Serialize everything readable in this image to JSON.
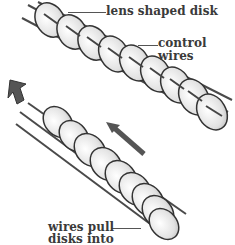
{
  "figure": {
    "colors": {
      "disk_fill": "#e8e8e8",
      "disk_edge": "#3c3c3c",
      "wire": "#4a4a4a",
      "arrow": "#555555",
      "background": "#ffffff"
    },
    "labels": {
      "lens_disk": "lens shaped disk",
      "control_wires_line1": "control",
      "control_wires_line2": "wires",
      "wires_pull_line1": "wires pull",
      "wires_pull_line2": "disks into"
    },
    "upper_chain": {
      "disk_count": 10
    },
    "lower_chain": {
      "disk_count": 10
    },
    "arrows": [
      {
        "name": "bend-direction-arrow",
        "direction": "up-left"
      },
      {
        "name": "pull-direction-arrow",
        "direction": "up-left"
      }
    ]
  }
}
